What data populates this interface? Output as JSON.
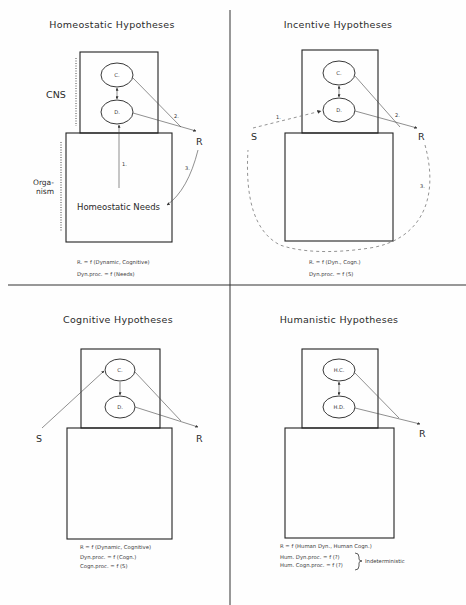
{
  "figure": {
    "quadrants": [
      {
        "id": "homeostatic",
        "title": "Homeostatic Hypotheses",
        "side_labels": {
          "cns": "CNS",
          "organism_1": "Orga-",
          "organism_2": "nism"
        },
        "nodes": {
          "c": "C.",
          "d": "D.",
          "r": "R",
          "inner_label": "Homeostatic Needs"
        },
        "arrow_labels": {
          "a1": "1.",
          "a2": "2.",
          "a3": "3."
        },
        "formulas": [
          "R. = f (Dynamic, Cognitive)",
          "Dyn.proc. = f (Needs)"
        ]
      },
      {
        "id": "incentive",
        "title": "Incentive Hypotheses",
        "nodes": {
          "c": "C.",
          "d": "D.",
          "s": "S",
          "r": "R"
        },
        "arrow_labels": {
          "a1": "1.",
          "a2": "2.",
          "a3": "3."
        },
        "formulas": [
          "R. = f (Dyn., Cogn.)",
          "Dyn.proc. = f (S)"
        ]
      },
      {
        "id": "cognitive",
        "title": "Cognitive Hypotheses",
        "nodes": {
          "c": "C.",
          "d": "D.",
          "s": "S",
          "r": "R"
        },
        "formulas": [
          "R = f (Dynamic, Cognitive)",
          "Dyn.proc. = f (Cogn.)",
          "Cogn.proc. = f (S)"
        ]
      },
      {
        "id": "humanistic",
        "title": "Humanistic Hypotheses",
        "nodes": {
          "c": "H.C.",
          "d": "H.D.",
          "r": "R"
        },
        "formulas": [
          "R = f (Human Dyn., Human Cogn.)",
          "Hum. Dyn.proc. = f (?)",
          "Hum. Cogn.proc. = f (?)"
        ],
        "brace_label": "Indeterministic"
      }
    ]
  }
}
